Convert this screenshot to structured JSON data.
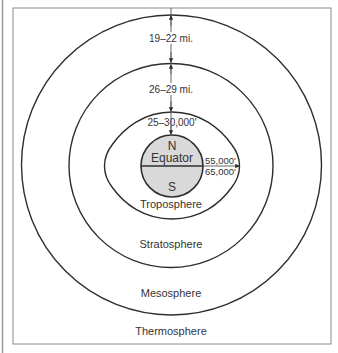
{
  "diagram": {
    "colors": {
      "line": "#2e2e2e",
      "frame": "#8a8a8a",
      "earth_fill": "#d9d9d9",
      "text": "#333333"
    },
    "layers": [
      {
        "name": "Thermosphere"
      },
      {
        "name": "Mesosphere"
      },
      {
        "name": "Stratosphere"
      },
      {
        "name": "Troposphere"
      }
    ],
    "earth": {
      "north": "N",
      "equator": "Equator",
      "south": "S"
    },
    "measurements": {
      "mesosphere_thickness": "19–22 mi.",
      "stratosphere_thickness": "26–29 mi.",
      "troposphere_polar_height": "25–30,000'",
      "troposphere_equator_low": "55,000'",
      "troposphere_equator_high": "65,000'"
    }
  }
}
